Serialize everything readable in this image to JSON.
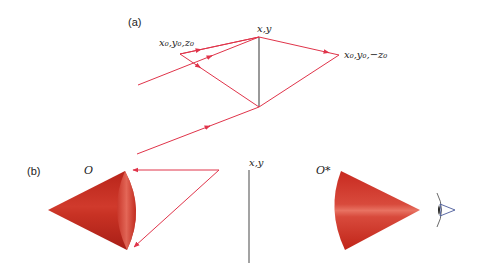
{
  "panel_a": {
    "label": "(a)",
    "point_left": "x₀,y₀,z₀",
    "point_top": "x,y",
    "point_right": "x₀,y₀,−z₀"
  },
  "panel_b": {
    "label": "(b)",
    "object_label": "O",
    "image_label": "O*",
    "plane_label": "x,y"
  },
  "colors": {
    "ray": "#e0344a",
    "plane": "#555555",
    "cone": "#c62a1e",
    "cone_highlight": "#e86a5a",
    "eye": "#4a5a9a"
  }
}
